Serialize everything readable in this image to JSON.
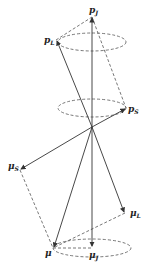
{
  "diagram": {
    "colors": {
      "line": "#333333",
      "dash": "#555555",
      "background": "#ffffff"
    },
    "labels": {
      "pJ": {
        "base": "p",
        "sub": "J"
      },
      "pL": {
        "base": "p",
        "sub": "L"
      },
      "pS": {
        "base": "p",
        "sub": "S"
      },
      "muS": {
        "base": "μ",
        "sub": "S"
      },
      "muL": {
        "base": "μ",
        "sub": "L"
      },
      "mu": {
        "base": "μ",
        "sub": ""
      },
      "muJ": {
        "base": "μ",
        "sub": "J"
      }
    },
    "points": {
      "origin": [
        92,
        127
      ],
      "pJ": [
        92,
        17
      ],
      "pL": [
        56,
        40
      ],
      "pS": [
        126,
        108
      ],
      "muS": [
        20,
        170
      ],
      "muL": [
        125,
        213
      ],
      "mu": [
        53,
        248
      ],
      "muJ": [
        92,
        248
      ]
    }
  }
}
